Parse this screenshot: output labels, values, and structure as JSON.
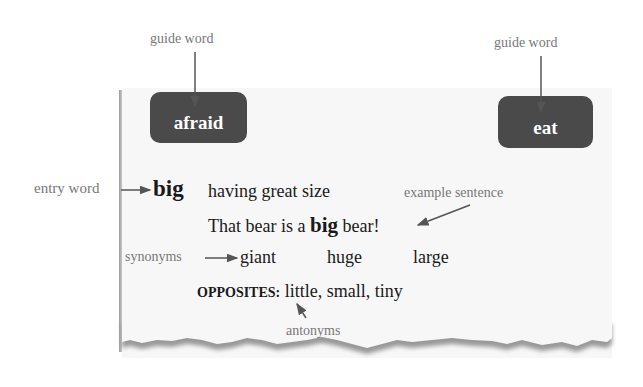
{
  "guide_words": [
    {
      "label": "guide word",
      "word": "afraid"
    },
    {
      "label": "guide word",
      "word": "eat"
    }
  ],
  "entry": {
    "callout": "entry word",
    "word": "big",
    "definition": "having great size"
  },
  "example": {
    "callout": "example sentence",
    "before": "That bear is a",
    "bold": "big",
    "after": "bear!"
  },
  "synonyms": {
    "callout": "synonyms",
    "words": [
      "giant",
      "huge",
      "large"
    ]
  },
  "antonyms": {
    "callout": "antonyms",
    "heading": "OPPOSITES:",
    "words": "little, small, tiny"
  },
  "colors": {
    "guide_box": "#4a4a4a",
    "callout_text": "#777777",
    "arrow": "#555555",
    "body_text": "#1a1a1a"
  }
}
